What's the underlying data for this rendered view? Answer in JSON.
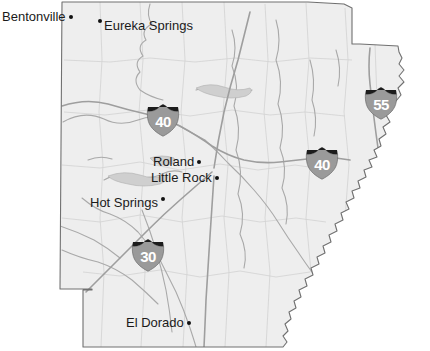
{
  "map": {
    "title": "Arkansas state map",
    "state_name": "Arkansas",
    "colors": {
      "land_fill": "#eeeeee",
      "land_stroke": "#6e6e6e",
      "county_line": "#c9c9c9",
      "river_line": "#b8b8b8",
      "highway_line": "#a8a8a8",
      "label_text": "#1a1a1a",
      "shield_body": "#9a9a9a",
      "shield_crown": "#1c1c1c",
      "shield_text": "#ffffff",
      "background": "#ffffff"
    },
    "cities": [
      {
        "name": "Bentonville",
        "marker": "dot-after",
        "x": 2,
        "y": 10
      },
      {
        "name": "Eureka Springs",
        "marker": "dot-before",
        "x": 98,
        "y": 19
      },
      {
        "name": "Roland",
        "marker": "dot-after",
        "x": 153,
        "y": 155
      },
      {
        "name": "Little Rock",
        "marker": "dot-after",
        "x": 151,
        "y": 171
      },
      {
        "name": "Hot Springs",
        "marker": "dot-after-raised",
        "x": 90,
        "y": 196
      },
      {
        "name": "El Dorado",
        "marker": "dot-after",
        "x": 126,
        "y": 316
      }
    ],
    "shields": [
      {
        "route": "40",
        "type": "interstate",
        "x": 144,
        "y": 103
      },
      {
        "route": "55",
        "type": "interstate",
        "x": 362,
        "y": 86
      },
      {
        "route": "40",
        "type": "interstate",
        "x": 303,
        "y": 146
      },
      {
        "route": "30",
        "type": "interstate",
        "x": 129,
        "y": 238
      }
    ]
  }
}
